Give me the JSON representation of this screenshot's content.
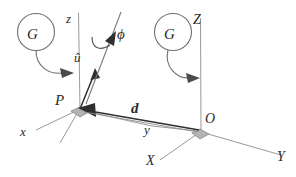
{
  "figure": {
    "type": "geometry-diagram",
    "width": 296,
    "height": 177,
    "background_color": "#ffffff"
  },
  "labels": {
    "frame_local": {
      "origin": "P",
      "axis_x": "x",
      "axis_y": "y",
      "axis_z": "z"
    },
    "frame_global": {
      "origin": "O",
      "axis_X": "X",
      "axis_Y": "Y",
      "axis_Z": "Z"
    },
    "vector_d": "d",
    "unit_vector": "û",
    "rotation_angle": "ϕ",
    "callout_left": "G",
    "callout_right": "G"
  },
  "colors": {
    "stroke_axis": "#8d8d8d",
    "stroke_vector": "#2f2f2f",
    "stroke_callout": "#6f6f6f",
    "marker_fill": "#b4b4b4",
    "text": "#2b2b2b"
  },
  "annotations": [
    {
      "name": "right-angle-marker-P",
      "at_point": "P"
    },
    {
      "name": "right-angle-marker-O",
      "at_point": "O"
    },
    {
      "name": "callout-arrow-left",
      "from": "G",
      "to": "z-axis"
    },
    {
      "name": "callout-arrow-right",
      "from": "G",
      "to": "Z-axis"
    },
    {
      "name": "rotation-arrow-phi",
      "about": "û"
    },
    {
      "name": "vector-arrow-d",
      "from": "O",
      "to": "P"
    }
  ]
}
